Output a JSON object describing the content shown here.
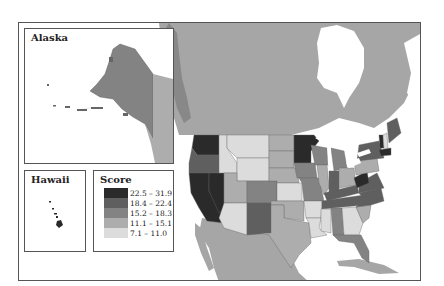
{
  "map": {
    "title": "",
    "insets": {
      "alaska": {
        "title": "Alaska"
      },
      "hawaii": {
        "title": "Hawaii"
      }
    },
    "legend": {
      "title": "Score",
      "items": [
        {
          "label": "22.5 – 31.9",
          "color": "#2a2a2a"
        },
        {
          "label": "18.4 – 22.4",
          "color": "#5f5f5f"
        },
        {
          "label": "15.2 – 18.3",
          "color": "#838383"
        },
        {
          "label": "11.1 – 15.1",
          "color": "#adadad"
        },
        {
          "label": "7.1 – 11.0",
          "color": "#dcdcdc"
        }
      ]
    },
    "colors": {
      "background_land": "#a6a6a6",
      "water": "#ffffff",
      "border": "#555555"
    },
    "states": {
      "Washington": "22.5 – 31.9",
      "Oregon": "18.4 – 22.4",
      "California": "22.5 – 31.9",
      "Nevada": "22.5 – 31.9",
      "Idaho": "7.1 – 11.0",
      "Montana": "7.1 – 11.0",
      "Wyoming": "7.1 – 11.0",
      "Utah": "11.1 – 15.1",
      "Arizona": "7.1 – 11.0",
      "Colorado": "15.2 – 18.3",
      "New Mexico": "18.4 – 22.4",
      "North Dakota": "11.1 – 15.1",
      "South Dakota": "11.1 – 15.1",
      "Nebraska": "11.1 – 15.1",
      "Kansas": "7.1 – 11.0",
      "Oklahoma": "11.1 – 15.1",
      "Texas": "11.1 – 15.1",
      "Minnesota": "22.5 – 31.9",
      "Iowa": "15.2 – 18.3",
      "Missouri": "15.2 – 18.3",
      "Arkansas": "7.1 – 11.0",
      "Louisiana": "7.1 – 11.0",
      "Wisconsin": "15.2 – 18.3",
      "Illinois": "11.1 – 15.1",
      "Michigan": "15.2 – 18.3",
      "Indiana": "18.4 – 22.4",
      "Ohio": "11.1 – 15.1",
      "Kentucky": "18.4 – 22.4",
      "Tennessee": "18.4 – 22.4",
      "Mississippi": "7.1 – 11.0",
      "Alabama": "15.2 – 18.3",
      "Georgia": "7.1 – 11.0",
      "Florida": "15.2 – 18.3",
      "South Carolina": "11.1 – 15.1",
      "North Carolina": "18.4 – 22.4",
      "Virginia": "18.4 – 22.4",
      "West Virginia": "22.5 – 31.9",
      "Pennsylvania": "11.1 – 15.1",
      "New York": "18.4 – 22.4",
      "Vermont": "22.5 – 31.9",
      "New Hampshire": "7.1 – 11.0",
      "Maine": "18.4 – 22.4",
      "Massachusetts": "22.5 – 31.9",
      "Alaska": "15.2 – 18.3",
      "Hawaii": "22.5 – 31.9"
    }
  }
}
